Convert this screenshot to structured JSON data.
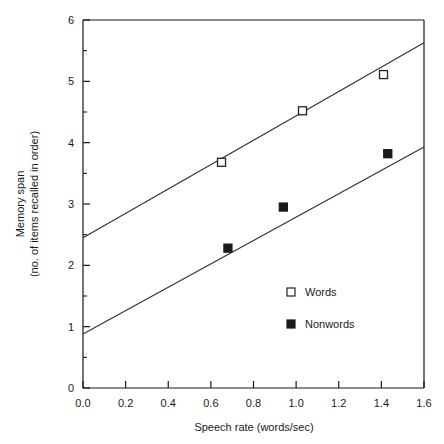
{
  "chart_data": {
    "type": "scatter",
    "title": "",
    "xlabel": "Speech rate (words/sec)",
    "ylabel_line1": "Memory span",
    "ylabel_line2": "(no. of items recalled in order)",
    "xlim": [
      0.0,
      1.6
    ],
    "ylim": [
      0,
      6
    ],
    "xticks": [
      "0.0",
      "0.2",
      "0.4",
      "0.6",
      "0.8",
      "1.0",
      "1.2",
      "1.4",
      "1.6"
    ],
    "xtick_values": [
      0.0,
      0.2,
      0.4,
      0.6,
      0.8,
      1.0,
      1.2,
      1.4,
      1.6
    ],
    "yticks": [
      "0",
      "1",
      "2",
      "3",
      "4",
      "5",
      "6"
    ],
    "ytick_values": [
      0,
      1,
      2,
      3,
      4,
      5,
      6
    ],
    "yminor_values": [
      0.5,
      1.5,
      2.5,
      3.5,
      4.5,
      5.5
    ],
    "grid": false,
    "legend_position": "center-right-inside",
    "series": [
      {
        "name": "Words",
        "marker": "open-square",
        "marker_fill": "#ffffff",
        "marker_stroke": "#222222",
        "points": [
          {
            "x": 0.65,
            "y": 3.68
          },
          {
            "x": 1.03,
            "y": 4.52
          },
          {
            "x": 1.41,
            "y": 5.11
          }
        ],
        "fit_line": {
          "x0": 0.0,
          "y0": 2.45,
          "x1": 1.6,
          "y1": 5.63,
          "slope": 1.99,
          "intercept": 2.45
        }
      },
      {
        "name": "Nonwords",
        "marker": "filled-square",
        "marker_fill": "#1a1a1a",
        "marker_stroke": "#1a1a1a",
        "points": [
          {
            "x": 0.68,
            "y": 2.28
          },
          {
            "x": 0.94,
            "y": 2.95
          },
          {
            "x": 1.43,
            "y": 3.82
          }
        ],
        "fit_line": {
          "x0": 0.0,
          "y0": 0.88,
          "x1": 1.6,
          "y1": 3.93,
          "slope": 1.91,
          "intercept": 0.88
        }
      }
    ]
  },
  "legend": {
    "entries": [
      {
        "label": "Words",
        "marker": "open-square"
      },
      {
        "label": "Nonwords",
        "marker": "filled-square"
      }
    ]
  },
  "colors": {
    "axis": "#1a1a1a",
    "line": "#333333",
    "background": "#ffffff",
    "marker_open_fill": "#ffffff",
    "marker_filled_fill": "#1a1a1a"
  }
}
